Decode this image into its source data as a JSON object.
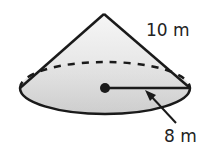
{
  "figure": {
    "shape": "cone",
    "slant_height_label": "10 m",
    "radius_label": "8 m",
    "colors": {
      "stroke": "#1a1a1a",
      "fill_light": "#f2f2f2",
      "fill_dark": "#c8c8c8",
      "text": "#222222"
    }
  }
}
